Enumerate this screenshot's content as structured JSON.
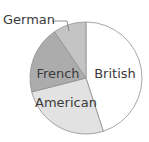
{
  "chart_data": {
    "type": "pie",
    "title": "",
    "start_angle_deg": 0,
    "direction": "clockwise",
    "slices": [
      {
        "label": "British",
        "value": 45.0,
        "color": "#ffffff",
        "label_pos": [
          115,
          78
        ],
        "anchor": "middle"
      },
      {
        "label": "American",
        "value": 26.0,
        "color": "#e2e2e2",
        "label_pos": [
          66,
          107
        ],
        "anchor": "middle"
      },
      {
        "label": "French",
        "value": 19.5,
        "color": "#acacac",
        "label_pos": [
          58,
          78
        ],
        "anchor": "middle"
      },
      {
        "label": "German",
        "value": 9.5,
        "color": "#c4c4c4",
        "label_pos": [
          3,
          24
        ],
        "anchor": "start",
        "leader": true
      }
    ],
    "legend": "none",
    "outline_color": "#8f8f8f"
  }
}
